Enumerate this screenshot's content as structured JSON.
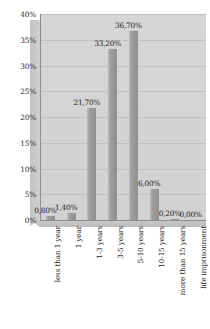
{
  "chart_data": {
    "type": "bar",
    "title": "",
    "subtitle": "",
    "xlabel": "",
    "ylabel": "",
    "categories": [
      "less than 1 year",
      "1 year",
      "1-3 years",
      "3-5 years",
      "5-10 years",
      "10-15 years",
      "more than 15 years",
      "life imprisonment"
    ],
    "values": [
      0.8,
      1.4,
      21.7,
      33.2,
      36.7,
      6.0,
      0.2,
      0.0
    ],
    "data_labels": [
      "0,80%",
      "1,40%",
      "21,70%",
      "33,20%",
      "36,70%",
      "6,00%",
      "0,20%",
      "0,00%"
    ],
    "ylim": [
      0,
      40
    ],
    "ytick_values": [
      0,
      5,
      10,
      15,
      20,
      25,
      30,
      35,
      40
    ],
    "ytick_labels": [
      "0%",
      "5%",
      "10%",
      "15%",
      "20%",
      "25%",
      "30%",
      "35%",
      "40%"
    ],
    "grid": true,
    "legend": "none",
    "series_color": "#9e9e9e",
    "plot_background": "#d4d4d4",
    "decimal_separator": ","
  }
}
